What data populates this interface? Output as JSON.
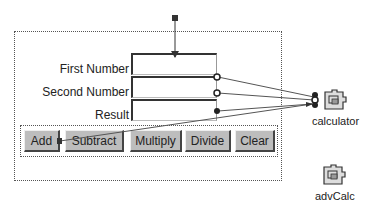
{
  "form": {
    "fields": [
      {
        "label": "First Number",
        "value": ""
      },
      {
        "label": "Second Number",
        "value": ""
      },
      {
        "label": "Result",
        "value": ""
      }
    ],
    "buttons": [
      {
        "label": "Add"
      },
      {
        "label": "Subtract"
      },
      {
        "label": "Multiply"
      },
      {
        "label": "Divide"
      },
      {
        "label": "Clear"
      }
    ]
  },
  "beans": [
    {
      "name": "calculator",
      "icon": "puzzle-bean-icon"
    },
    {
      "name": "advCalc",
      "icon": "puzzle-bean-icon"
    }
  ],
  "colors": {
    "canvas_bg": "#ffffff",
    "button_bg": "#bdbdbd",
    "wire": "#333333"
  }
}
